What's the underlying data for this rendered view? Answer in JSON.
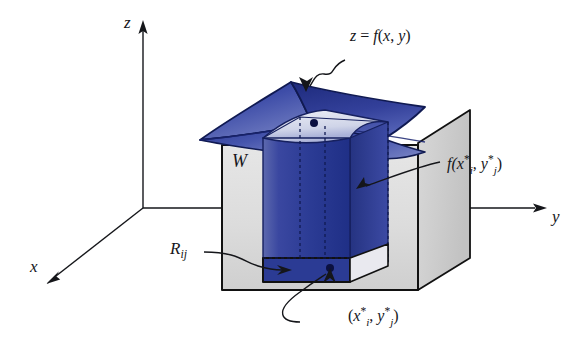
{
  "figure": {
    "axes": {
      "z_label": "z",
      "x_label": "x",
      "y_label": "y"
    },
    "labels": {
      "surface": "z = f(x, y)",
      "solid_region": "W",
      "height_value_f": "f(",
      "height_value_x": "x",
      "height_value_xsub": "i",
      "height_value_star1": "*",
      "height_value_comma": ", ",
      "height_value_y": "y",
      "height_value_ysub": "j",
      "height_value_star2": "*",
      "height_value_close": ")",
      "base_rect": "R",
      "base_rect_sub": "ij",
      "sample_point_open": "(",
      "sample_point_x": "x",
      "sample_point_xsub": "i",
      "sample_point_star1": "*",
      "sample_point_comma": ", ",
      "sample_point_y": "y",
      "sample_point_ysub": "j",
      "sample_point_star2": "*",
      "sample_point_close": ")"
    },
    "surface_equation": {
      "z": "z",
      "equals": " = ",
      "f": "f",
      "open": "(",
      "x": "x",
      "comma": ", ",
      "y": "y",
      "close": ")"
    },
    "colors": {
      "surface_blue_dark": "#1b2a7a",
      "surface_blue_mid": "#39499f",
      "surface_blue_light": "#8e9acb",
      "column_blue": "#2c3f96",
      "box_gray_light": "#dcdcdc",
      "box_gray_mid": "#cbcbcb",
      "shadow_gray": "#b4b4b4",
      "outline": "#111111",
      "ink": "#15161a"
    },
    "geometry": {
      "origin_x": 143,
      "origin_y": 208,
      "z_axis_top_y": 22,
      "y_axis_end_x": 545,
      "x_axis_end_x": 46,
      "x_axis_end_y": 283
    }
  }
}
